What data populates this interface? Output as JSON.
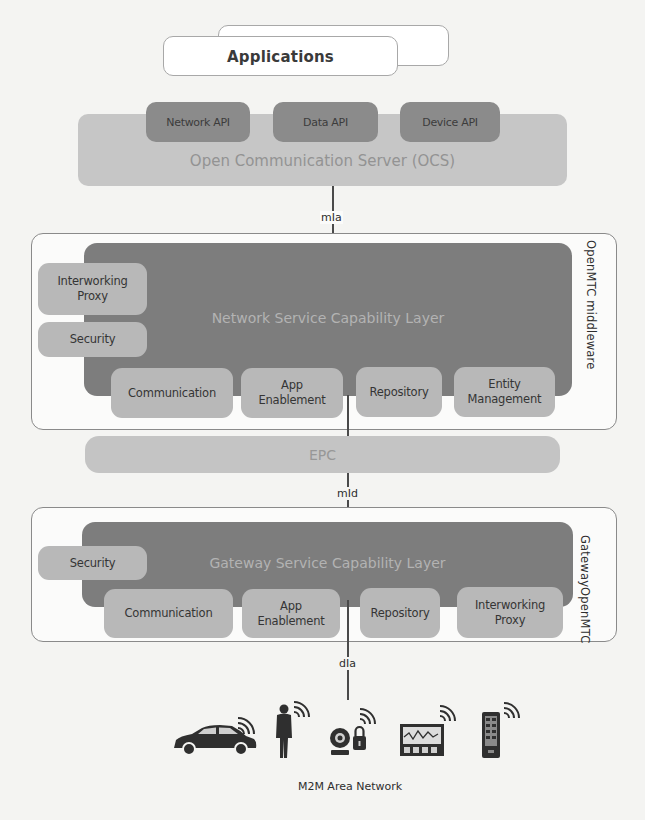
{
  "applications": {
    "label": "Applications"
  },
  "ocs": {
    "label": "Open Communication Server (OCS)",
    "apis": [
      {
        "label": "Network API"
      },
      {
        "label": "Data API"
      },
      {
        "label": "Device API"
      }
    ]
  },
  "interfaces": {
    "mia": "mIa",
    "mid": "mId",
    "dia": "dIa"
  },
  "middleware": {
    "side_label": "OpenMTC middleware",
    "layer_label": "Network Service Capability Layer",
    "left_modules": [
      {
        "line1": "Interworking",
        "line2": "Proxy"
      },
      {
        "line1": "Security",
        "line2": ""
      }
    ],
    "bottom_modules": [
      {
        "line1": "Communication",
        "line2": ""
      },
      {
        "line1": "App",
        "line2": "Enablement"
      },
      {
        "line1": "Repository",
        "line2": ""
      },
      {
        "line1": "Entity",
        "line2": "Management"
      }
    ]
  },
  "epc": {
    "label": "EPC"
  },
  "gateway": {
    "side_label_line1": "OpenMTC",
    "side_label_line2": "Gateway",
    "layer_label": "Gateway Service Capability Layer",
    "left_modules": [
      {
        "line1": "Security",
        "line2": ""
      }
    ],
    "bottom_modules": [
      {
        "line1": "Communication",
        "line2": ""
      },
      {
        "line1": "App",
        "line2": "Enablement"
      },
      {
        "line1": "Repository",
        "line2": ""
      },
      {
        "line1": "Interworking",
        "line2": "Proxy"
      }
    ]
  },
  "area_network": {
    "label": "M2M Area Network",
    "devices": [
      {
        "icon": "car-icon"
      },
      {
        "icon": "person-icon"
      },
      {
        "icon": "camera-lock-icon"
      },
      {
        "icon": "monitor-icon"
      },
      {
        "icon": "phone-icon"
      }
    ]
  },
  "colors": {
    "dark_layer": "#7d7d7d",
    "module_pill": "#b8b8b8",
    "ocs_bar": "#c6c6c6",
    "api_pill": "#8b8b8b"
  }
}
